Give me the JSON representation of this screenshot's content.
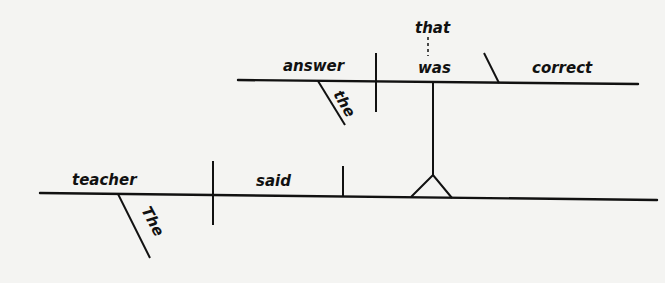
{
  "diagram": {
    "type": "sentence-diagram",
    "sentence": "The teacher said that the answer was correct",
    "main_clause": {
      "subject": "teacher",
      "subject_modifier": "The",
      "verb": "said",
      "direct_object": "noun clause (on pedestal)"
    },
    "noun_clause": {
      "introducer": "that",
      "subject": "answer",
      "subject_modifier": "the",
      "verb": "was",
      "predicate_adjective": "correct"
    }
  },
  "words": {
    "teacher": "teacher",
    "The": "The",
    "said": "said",
    "answer": "answer",
    "the": "the",
    "was": "was",
    "that": "that",
    "correct": "correct"
  }
}
